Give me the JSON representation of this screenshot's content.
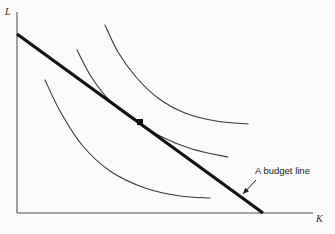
{
  "figure": {
    "background_color": "#fbfbfa",
    "axis_color": "#8a8a8a",
    "curve_color": "#3a3a3a",
    "line_color": "#111111",
    "annotation_color": "#1e1e1e",
    "width": 335,
    "height": 234
  },
  "axes": {
    "y_label": "L",
    "x_label": "K",
    "origin": {
      "x": 17,
      "y": 213
    },
    "y_top": {
      "x": 17,
      "y": 12
    },
    "x_right": {
      "x": 313,
      "y": 213
    }
  },
  "annotation": {
    "text": "A budget line",
    "text_x": 255,
    "text_y": 166,
    "arrow_from": {
      "x": 256,
      "y": 180
    },
    "arrow_to": {
      "x": 243,
      "y": 194
    }
  },
  "chart_data": {
    "type": "line",
    "title": "",
    "subtitle": "",
    "xlabel": "K",
    "ylabel": "L",
    "grid": false,
    "legend": false,
    "xlim": [
      0,
      100
    ],
    "ylim": [
      0,
      100
    ],
    "annotations": [
      {
        "text": "A budget line",
        "points_to": "budget-line"
      }
    ],
    "series": [
      {
        "name": "budget-line",
        "kind": "straight-line",
        "stroke_width": 3.2,
        "color": "#111111",
        "points": [
          [
            17,
            34
          ],
          [
            263,
            213
          ]
        ]
      },
      {
        "name": "isoquant-low",
        "kind": "convex-curve",
        "stroke_width": 1.1,
        "color": "#3a3a3a",
        "points": [
          [
            45,
            80
          ],
          [
            60,
            111
          ],
          [
            82,
            145
          ],
          [
            110,
            171
          ],
          [
            145,
            188
          ],
          [
            180,
            196
          ],
          [
            210,
            198
          ]
        ]
      },
      {
        "name": "isoquant-mid",
        "kind": "convex-curve",
        "stroke_width": 1.1,
        "color": "#3a3a3a",
        "points": [
          [
            77,
            50
          ],
          [
            92,
            78
          ],
          [
            112,
            103
          ],
          [
            133,
            119
          ],
          [
            160,
            136
          ],
          [
            192,
            149
          ],
          [
            228,
            157
          ]
        ]
      },
      {
        "name": "isoquant-high",
        "kind": "convex-curve",
        "stroke_width": 1.1,
        "color": "#3a3a3a",
        "points": [
          [
            105,
            25
          ],
          [
            118,
            52
          ],
          [
            136,
            77
          ],
          [
            158,
            98
          ],
          [
            185,
            113
          ],
          [
            216,
            121
          ],
          [
            248,
            124
          ]
        ]
      }
    ],
    "markers": [
      {
        "name": "tangency-point",
        "shape": "square",
        "size": 6,
        "color": "#111111",
        "x": 140,
        "y": 122
      }
    ]
  }
}
